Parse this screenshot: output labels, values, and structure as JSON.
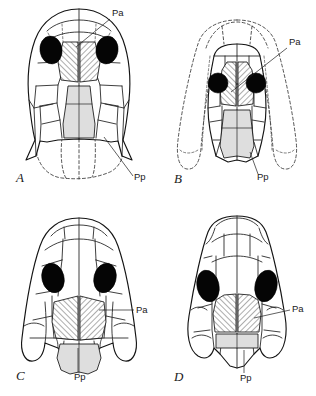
{
  "figure": {
    "background_color": "#ffffff",
    "line_color": "#1d1d1d",
    "orbit_color": "#050505",
    "parietal_fill": "#ffffff",
    "parietal_hatch_color": "#141414",
    "postparietal_fill": "#dedede"
  },
  "panels": [
    {
      "id": "A",
      "letter": "A",
      "letter_pos": {
        "x": 16,
        "y": 182
      },
      "annotations": [
        {
          "name": "Pa",
          "text": "Pa",
          "x": 112,
          "y": 16,
          "leader": "M110,19 L76,47"
        },
        {
          "name": "Pp",
          "text": "Pp",
          "x": 134,
          "y": 180,
          "leader": "M133,176 L104,137"
        }
      ],
      "orbit_shape": "oval",
      "has_dashed_rear": true,
      "parietal_region": "paired-elongate-hatched",
      "postparietal_region": "elongate-stippled"
    },
    {
      "id": "B",
      "letter": "B",
      "letter_pos": {
        "x": 16,
        "y": 183
      },
      "annotations": [
        {
          "name": "Pa",
          "text": "Pa",
          "x": 131,
          "y": 45,
          "leader": "M129,48 L73,92"
        },
        {
          "name": "Pp",
          "text": "Pp",
          "x": 99,
          "y": 180,
          "leader": "M100,174 L92,152"
        }
      ],
      "orbit_shape": "round",
      "has_dashed_rear": true,
      "parietal_region": "broad-hatched",
      "postparietal_region": "broad-stippled"
    },
    {
      "id": "C",
      "letter": "C",
      "letter_pos": {
        "x": 16,
        "y": 182
      },
      "annotations": [
        {
          "name": "Pa",
          "text": "Pa",
          "x": 136,
          "y": 114,
          "leader": "M134,112 L99,112"
        },
        {
          "name": "Pp",
          "text": "Pp",
          "x": 76,
          "y": 180,
          "leader": "M78,174 L78,148"
        }
      ],
      "orbit_shape": "oval",
      "has_dashed_rear": false,
      "parietal_region": "broad-hatched",
      "postparietal_region": "broad-stippled"
    },
    {
      "id": "D",
      "letter": "D",
      "letter_pos": {
        "x": 16,
        "y": 183
      },
      "annotations": [
        {
          "name": "Pa",
          "text": "Pa",
          "x": 134,
          "y": 113,
          "leader": "M132,112 L96,120"
        },
        {
          "name": "Pp",
          "text": "Pp",
          "x": 84,
          "y": 181,
          "leader": "M86,175 L86,152"
        }
      ],
      "orbit_shape": "oval",
      "has_dashed_rear": false,
      "parietal_region": "broad-hatched",
      "postparietal_region": "small-band-stippled"
    }
  ],
  "legend_keys": {
    "pa_full": "Pa",
    "pp_full": "Pp"
  }
}
